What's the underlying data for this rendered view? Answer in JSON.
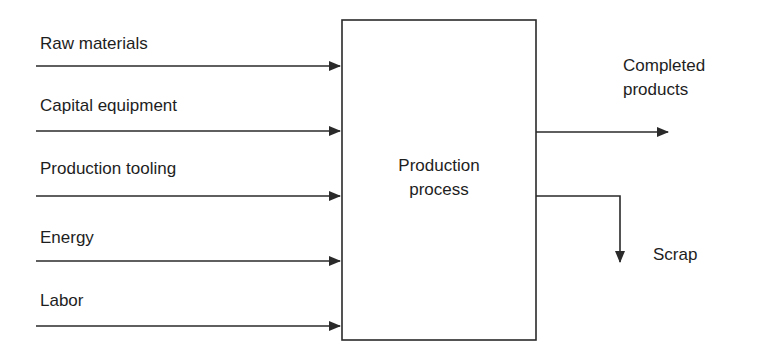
{
  "diagram": {
    "process": {
      "label_line1": "Production",
      "label_line2": "process"
    },
    "inputs": [
      {
        "label": "Raw materials"
      },
      {
        "label": "Capital equipment"
      },
      {
        "label": "Production tooling"
      },
      {
        "label": "Energy"
      },
      {
        "label": "Labor"
      }
    ],
    "outputs": {
      "completed": {
        "label_line1": "Completed",
        "label_line2": "products"
      },
      "scrap": {
        "label": "Scrap"
      }
    },
    "colors": {
      "stroke": "#2a2a2a",
      "text": "#1e1e1e",
      "background": "#ffffff"
    }
  }
}
